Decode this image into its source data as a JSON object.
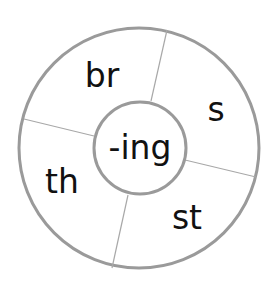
{
  "diagram": {
    "type": "word-wheel",
    "center": {
      "label": "-ing"
    },
    "segments": [
      {
        "label": "br"
      },
      {
        "label": "s"
      },
      {
        "label": "st"
      },
      {
        "label": "th"
      }
    ]
  },
  "colors": {
    "ring_stroke": "#9a9a9a",
    "divider_stroke": "#a8a8a8",
    "text": "#111111",
    "background": "#ffffff"
  }
}
